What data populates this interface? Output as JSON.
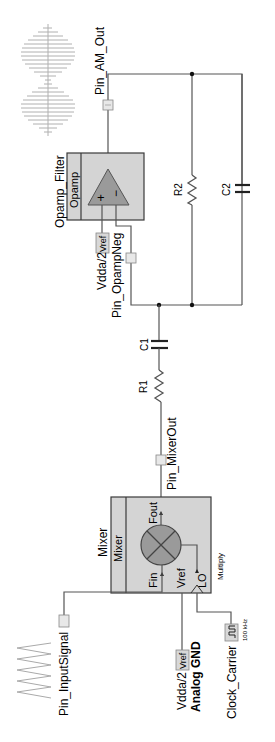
{
  "diagram": {
    "type": "schematic",
    "orientation": "rotated-90-ccw",
    "colors": {
      "block_fill": "#d4d4d4",
      "block_border": "#3a3a3a",
      "symbol_fill": "#9a9a9a",
      "wire": "#555555",
      "tag_fill": "#d8d8d8",
      "waveform": "#b0b0b0"
    },
    "components": {
      "opamp": {
        "instance_name": "Opamp_Filter",
        "type_label": "Opamp",
        "plus_symbol": "+",
        "minus_symbol": "−"
      },
      "mixer": {
        "instance_name": "Mixer",
        "type_label": "Mixer",
        "mode": "Multiply",
        "terminals": {
          "fin": "Fin",
          "fout": "Fout",
          "vref": "Vref",
          "lo": "LO"
        }
      },
      "r1": {
        "label": "R1"
      },
      "r2": {
        "label": "R2"
      },
      "c1": {
        "label": "C1"
      },
      "c2": {
        "label": "C2"
      },
      "vref_opamp": {
        "label": "Vdda/2",
        "tag": "Vref"
      },
      "vref_mixer": {
        "label": "Vdda/2",
        "tag": "Vref",
        "sublabel": "Analog GND"
      },
      "clock": {
        "label": "Clock_Carrier",
        "frequency": "100 kHz"
      }
    },
    "pins": {
      "am_out": "Pin_AM_Out",
      "opamp_neg": "Pin_OpampNeg",
      "mixer_out": "Pin_MixerOut",
      "input_signal": "Pin_InputSignal"
    },
    "waveforms": {
      "output": "am-modulated-waveform",
      "input": "sine-input-waveform"
    }
  }
}
